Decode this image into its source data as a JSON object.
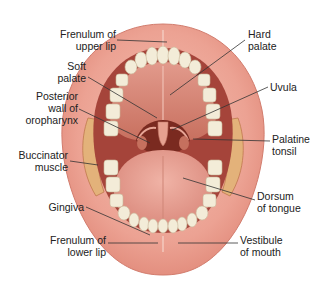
{
  "figure": {
    "colors": {
      "background": "#ffffff",
      "lip": "#e9998c",
      "lip_light": "#f2b8aa",
      "cavity_dark": "#8a2d22",
      "palate": "#d98578",
      "tongue": "#e8a294",
      "teeth": "#f3ecd8",
      "buccinator": "#e3b27a",
      "leader_line": "#333333",
      "text": "#222222"
    }
  },
  "labels": [
    {
      "id": "frenulum-upper-lip",
      "text": "Frenulum of\nupper lip",
      "side": "left",
      "x": 21,
      "y": 28,
      "w": 95,
      "line": [
        [
          117,
          40
        ],
        [
          167,
          42
        ]
      ]
    },
    {
      "id": "soft-palate",
      "text": "Soft\npalate",
      "side": "left",
      "x": 36,
      "y": 60,
      "w": 50,
      "line": [
        [
          88,
          77
        ],
        [
          157,
          118
        ]
      ]
    },
    {
      "id": "posterior-wall-oropharynx",
      "text": "Posterior\nwall of\noropharynx",
      "side": "left",
      "x": 2,
      "y": 90,
      "w": 76,
      "line": [
        [
          79,
          109
        ],
        [
          150,
          143
        ]
      ]
    },
    {
      "id": "buccinator-muscle",
      "text": "Buccinator\nmuscle",
      "side": "left",
      "x": 10,
      "y": 149,
      "w": 68,
      "line": [
        [
          70,
          161
        ],
        [
          98,
          165
        ]
      ]
    },
    {
      "id": "gingiva",
      "text": "Gingiva",
      "side": "left",
      "x": 40,
      "y": 200,
      "w": 46,
      "line": [
        [
          86,
          207
        ],
        [
          150,
          235
        ]
      ]
    },
    {
      "id": "frenulum-lower-lip",
      "text": "Frenulum of\nlower lip",
      "side": "left",
      "x": 22,
      "y": 233,
      "w": 84,
      "line": [
        [
          108,
          243
        ],
        [
          158,
          243
        ]
      ]
    },
    {
      "id": "hard-palate",
      "text": "Hard\npalate",
      "side": "left",
      "x": 248,
      "y": 28,
      "w": 50,
      "line": [
        [
          245,
          40
        ],
        [
          170,
          95
        ]
      ]
    },
    {
      "id": "uvula",
      "text": "Uvula",
      "side": "left",
      "x": 270,
      "y": 80,
      "w": 40,
      "line": [
        [
          268,
          87
        ],
        [
          172,
          130
        ]
      ]
    },
    {
      "id": "palatine-tonsil",
      "text": "Palatine\ntonsil",
      "side": "left",
      "x": 272,
      "y": 132,
      "w": 50,
      "line": [
        [
          270,
          141
        ],
        [
          193,
          139
        ]
      ]
    },
    {
      "id": "dorsum-of-tongue",
      "text": "Dorsum\nof tongue",
      "side": "left",
      "x": 257,
      "y": 190,
      "w": 62,
      "line": [
        [
          255,
          200
        ],
        [
          183,
          178
        ]
      ]
    },
    {
      "id": "vestibule-of-mouth",
      "text": "Vestibule\nof mouth",
      "side": "left",
      "x": 240,
      "y": 233,
      "w": 60,
      "line": [
        [
          238,
          243
        ],
        [
          178,
          243
        ]
      ]
    }
  ]
}
